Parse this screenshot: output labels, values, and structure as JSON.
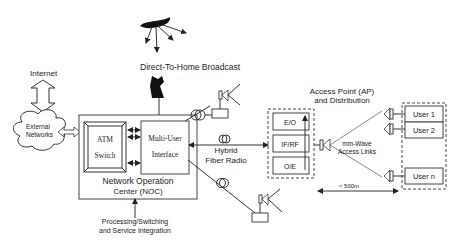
{
  "diagram": {
    "labels": {
      "dth_broadcast": "Direct-To-Home Broadcast",
      "internet": "Internet",
      "external_networks_1": "External",
      "external_networks_2": "Networks",
      "atm_1": "ATM",
      "atm_2": "Switch",
      "mui_1": "Multi-User",
      "mui_2": "Interface",
      "noc_1": "Network Operation",
      "noc_2": "Center  (NOC)",
      "processing_1": "Processing/Switching",
      "processing_2": "and Service Integration",
      "hfr_1": "Hybrid",
      "hfr_2": "Fiber Radio",
      "ap_1": "Access Point (AP)",
      "ap_2": "and Distribution",
      "eo": "E/O",
      "ifrf": "IF/RF",
      "oe": "O/E",
      "mmwave_1": "mm-Wave",
      "mmwave_2": "Access Links",
      "user1": "User 1",
      "user2": "User 2",
      "usern": "User n",
      "distance": "< 500m"
    },
    "colors": {
      "line": "#333333",
      "fill": "#111111",
      "background": "#ffffff"
    }
  }
}
